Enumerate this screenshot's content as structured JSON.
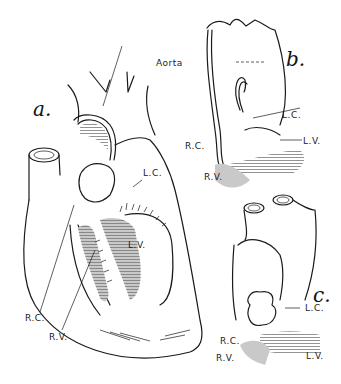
{
  "figure": {
    "panels": [
      {
        "id": "a",
        "label": "a."
      },
      {
        "id": "b",
        "label": "b."
      },
      {
        "id": "c",
        "label": "c."
      }
    ],
    "labels": {
      "aorta": "Aorta",
      "a_lc": "L.C.",
      "a_lv": "L.V.",
      "a_rc": "R.C.",
      "a_rv": "R.V.",
      "b_lc": "L.C.",
      "b_lv": "L.V.",
      "b_rc": "R.C.",
      "b_rv": "R.V.",
      "c_lc": "L.C.",
      "c_lv": "L.V.",
      "c_rc": "R.C.",
      "c_rv": "R.V."
    }
  }
}
